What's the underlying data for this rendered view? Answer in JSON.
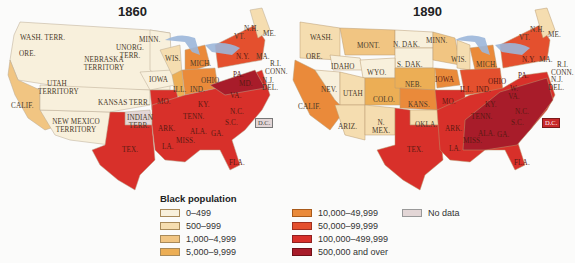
{
  "legend": {
    "title": "Black population",
    "items": [
      {
        "label": "0–499",
        "color": "#f8f0dc"
      },
      {
        "label": "500–999",
        "color": "#f5ddb0"
      },
      {
        "label": "1,000–4,999",
        "color": "#f1c582"
      },
      {
        "label": "5,000–9,999",
        "color": "#ecae55"
      },
      {
        "label": "10,000–49,999",
        "color": "#ea8a3a"
      },
      {
        "label": "50,000–99,999",
        "color": "#e4502e"
      },
      {
        "label": "100,000–499,999",
        "color": "#d8302a"
      },
      {
        "label": "500,000 and over",
        "color": "#a81c2a"
      },
      {
        "label": "No data",
        "color": "#e3d6d6"
      }
    ]
  },
  "maps": [
    {
      "year": "1860",
      "labels": [
        "WASH. TERR.",
        "ORE.",
        "UNORG. TERR.",
        "MINN.",
        "NEBRASKA TERRITORY",
        "UTAH TERRITORY",
        "IOWA",
        "WIS.",
        "MICH.",
        "KANSAS TERR.",
        "CALIF.",
        "NEW MEXICO TERRITORY",
        "INDIAN TERR.",
        "TEX.",
        "MO.",
        "ILL.",
        "IND.",
        "OHIO",
        "PA.",
        "N.Y.",
        "MA.",
        "N.H.",
        "VT.",
        "ME.",
        "R.I.",
        "CONN.",
        "N.J.",
        "DEL.",
        "MD.",
        "VA.",
        "KY.",
        "TENN.",
        "N.C.",
        "S.C.",
        "ARK.",
        "ALA.",
        "GA.",
        "MISS.",
        "LA.",
        "FLA.",
        "D.C."
      ]
    },
    {
      "year": "1890",
      "labels": [
        "WASH.",
        "ORE.",
        "IDAHO",
        "MONT.",
        "WYO.",
        "N. DAK.",
        "S. DAK.",
        "MINN.",
        "NEB.",
        "IOWA",
        "WIS.",
        "MICH.",
        "NEV.",
        "UTAH",
        "COLO.",
        "KANS.",
        "CALIF.",
        "ARIZ.",
        "N. MEX.",
        "OKLA.",
        "TEX.",
        "MO.",
        "ILL.",
        "IND.",
        "OHIO",
        "W. VA.",
        "PA.",
        "N.Y.",
        "MA.",
        "N.H.",
        "VT.",
        "ME.",
        "R.I.",
        "CONN.",
        "N.J.",
        "DEL.",
        "KY.",
        "TENN.",
        "N.C.",
        "S.C.",
        "ARK.",
        "ALA.",
        "GA.",
        "MISS.",
        "LA.",
        "FLA.",
        "D.C."
      ]
    }
  ]
}
